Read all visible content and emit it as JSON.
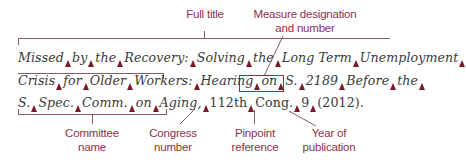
{
  "labels": {
    "full_title": "Full title",
    "measure_line1": "Measure designation",
    "measure_line2": "and number",
    "committee_line1": "Committee",
    "committee_line2": "name",
    "congress_line1": "Congress",
    "congress_line2": "number",
    "pinpoint_line1": "Pinpoint",
    "pinpoint_line2": "reference",
    "year_line1": "Year of",
    "year_line2": "publication"
  },
  "citation": {
    "line1": [
      "Missed",
      "by",
      "the",
      "Recovery:",
      "Solving",
      "the",
      "Long Term",
      "Unemployment"
    ],
    "line2": [
      "Crisis",
      "for",
      "Older",
      "Workers:",
      "Hearing",
      "on",
      "S.",
      "2189",
      "Before",
      "the"
    ],
    "line3_italic": [
      "S.",
      "Spec.",
      "Comm.",
      "on",
      "Aging,"
    ],
    "line3_roman": [
      "112th",
      "Cong.",
      "9",
      "(2012)."
    ]
  },
  "colors": {
    "label": "#8a3347",
    "space_marker": "#7a1a2a",
    "text": "#3a3a3a"
  }
}
